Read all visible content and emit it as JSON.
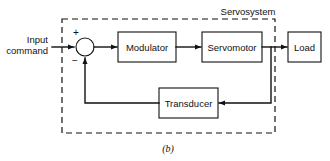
{
  "figure": {
    "caption": "(b)",
    "boundary_label": "Servosystem",
    "input_label_line1": "Input",
    "input_label_line2": "command",
    "sign_positive": "+",
    "sign_negative": "−",
    "stroke_color": "#111111",
    "background_color": "#ffffff"
  },
  "blocks": [
    {
      "id": "modulator",
      "label": "Modulator",
      "x": 118,
      "y": 32,
      "w": 58,
      "h": 30
    },
    {
      "id": "servomotor",
      "label": "Servomotor",
      "x": 202,
      "y": 32,
      "w": 60,
      "h": 30
    },
    {
      "id": "load",
      "label": "Load",
      "x": 288,
      "y": 32,
      "w": 33,
      "h": 30
    },
    {
      "id": "transducer",
      "label": "Transducer",
      "x": 159,
      "y": 88,
      "w": 59,
      "h": 30
    }
  ],
  "summing_junction": {
    "id": "summing-junction",
    "cx": 85,
    "cy": 47,
    "r": 9
  },
  "boundary_box": {
    "x": 62,
    "y": 19,
    "w": 213,
    "h": 114
  },
  "connections": [
    {
      "id": "input-to-sum",
      "from": "input command",
      "to": "summing junction"
    },
    {
      "id": "sum-to-modulator",
      "from": "summing junction",
      "to": "modulator"
    },
    {
      "id": "modulator-to-servomotor",
      "from": "modulator",
      "to": "servomotor"
    },
    {
      "id": "servomotor-to-load",
      "from": "servomotor",
      "to": "load"
    },
    {
      "id": "servomotor-to-transducer",
      "from": "servomotor tap",
      "to": "transducer"
    },
    {
      "id": "transducer-to-sum",
      "from": "transducer",
      "to": "summing junction"
    }
  ]
}
